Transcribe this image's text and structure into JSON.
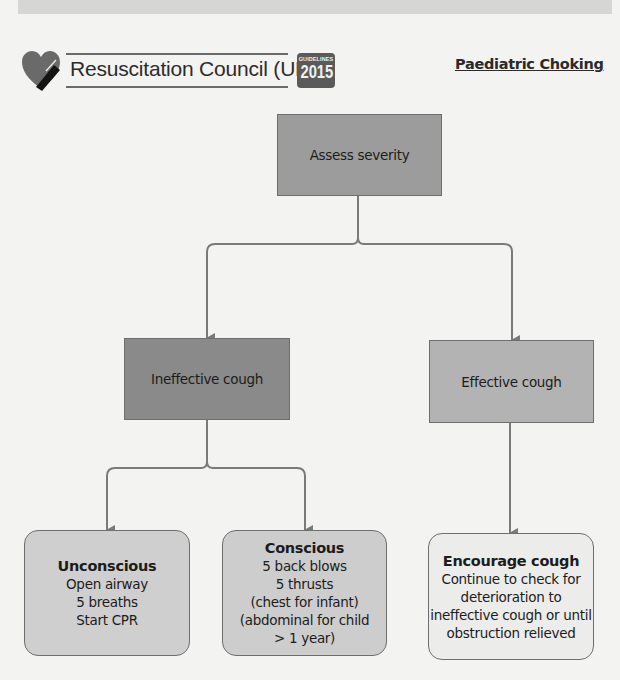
{
  "header": {
    "organization": "Resuscitation Council (UK)",
    "badge": {
      "label": "GUIDELINES",
      "year": "2015"
    },
    "logo_icon": "heart-logo-icon",
    "title": "Paediatric Choking"
  },
  "colors": {
    "assess_fill": "#9c9c9c",
    "ineffective_fill": "#8a8a8a",
    "effective_fill": "#b3b3b3",
    "unconscious_fill": "#cfcfcf",
    "conscious_fill": "#cdcdcd",
    "encourage_fill": "#ececea",
    "connector": "#7a7a7a",
    "badge_fill": "#5a5a5a"
  },
  "flowchart": {
    "assess": {
      "label": "Assess severity"
    },
    "ineffective": {
      "label": "Ineffective cough"
    },
    "effective": {
      "label": "Effective cough"
    },
    "unconscious": {
      "heading": "Unconscious",
      "lines": [
        "Open airway",
        "5 breaths",
        "Start CPR"
      ]
    },
    "conscious": {
      "heading": "Conscious",
      "lines": [
        "5 back blows",
        "5 thrusts",
        "(chest for infant)",
        "(abdominal for child",
        "> 1 year)"
      ]
    },
    "encourage": {
      "heading": "Encourage cough",
      "lines": [
        "Continue to check for",
        "deterioration to",
        "ineffective cough or until",
        "obstruction relieved"
      ]
    },
    "edges": [
      {
        "from": "assess",
        "to": "ineffective"
      },
      {
        "from": "assess",
        "to": "effective"
      },
      {
        "from": "ineffective",
        "to": "unconscious"
      },
      {
        "from": "ineffective",
        "to": "conscious"
      },
      {
        "from": "effective",
        "to": "encourage"
      }
    ]
  }
}
